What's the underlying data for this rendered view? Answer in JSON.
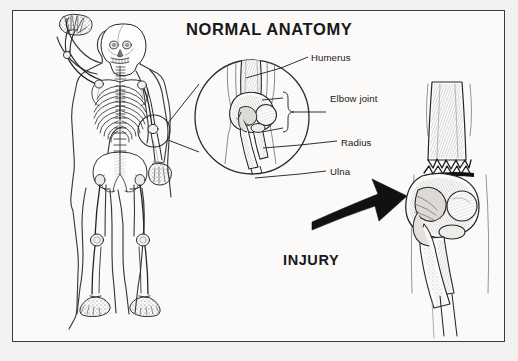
{
  "figure": {
    "kind": "medical-illustration",
    "background_color": "#f2f1ef",
    "panel_color": "#fbfaf8",
    "ink_color": "#1b1b1d",
    "frame_color": "#3a3a3c"
  },
  "title": "NORMAL ANATOMY",
  "injury_caption": "INJURY",
  "labels": [
    {
      "id": "humerus",
      "text": "Humerus"
    },
    {
      "id": "elbow-joint",
      "text": "Elbow joint"
    },
    {
      "id": "radius",
      "text": "Radius"
    },
    {
      "id": "ulna",
      "text": "Ulna"
    }
  ],
  "panels": {
    "skeleton": {
      "name": "full-body-skeleton",
      "pose": "standing, right arm raised beside head",
      "marker": "small circle around left elbow"
    },
    "magnifier": {
      "name": "magnified-normal-elbow",
      "shape": "circle",
      "contents": "humerus, elbow joint, radius, ulna"
    },
    "injury": {
      "name": "fractured-elbow",
      "contents": "distal humerus with jagged transverse fracture line above the condyles"
    },
    "arrow": {
      "name": "injury-arrow",
      "direction": "curved, pointing up and to the right",
      "color": "#111113"
    }
  }
}
